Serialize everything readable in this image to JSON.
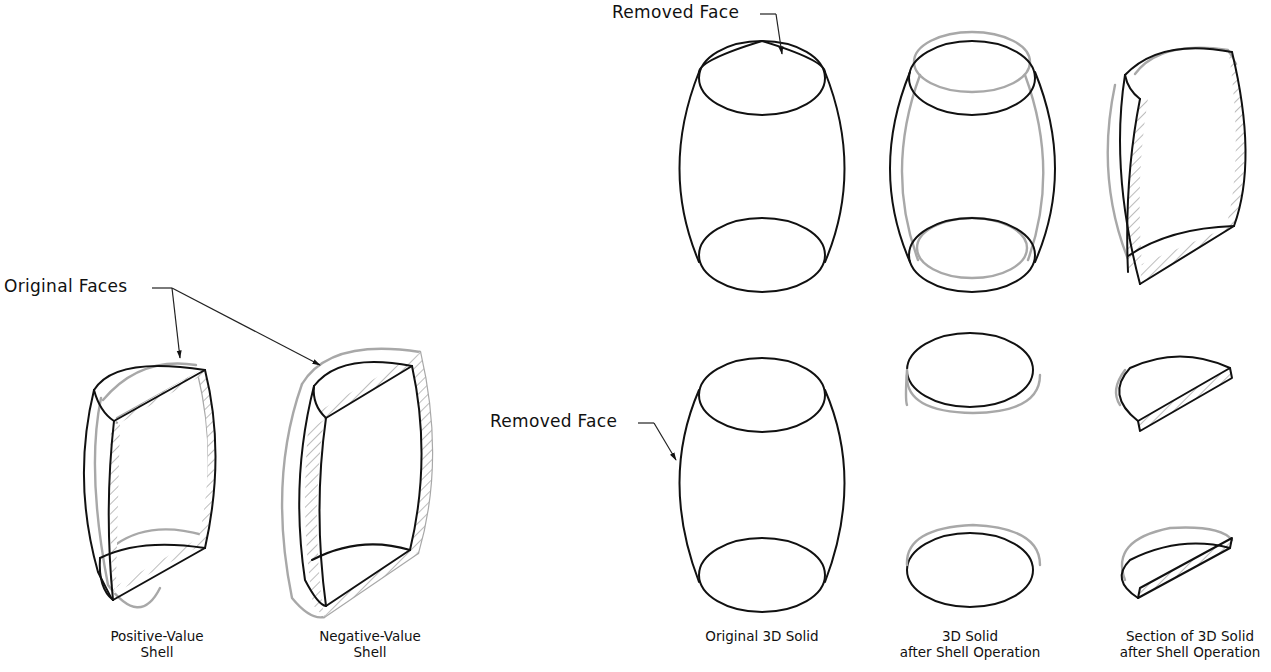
{
  "figure": {
    "callouts": {
      "original_faces": "Original Faces",
      "removed_face_top": "Removed Face",
      "removed_face_side": "Removed Face"
    },
    "captions": {
      "positive": [
        "Positive-Value",
        "Shell"
      ],
      "negative": [
        "Negative-Value",
        "Shell"
      ],
      "original": [
        "Original 3D Solid"
      ],
      "after_shell": [
        "3D Solid",
        "after Shell Operation"
      ],
      "section": [
        "Section of 3D Solid",
        "after Shell Operation"
      ]
    },
    "colors": {
      "outline": "#111111",
      "shell_offset": "#a8a8a8",
      "background": "#ffffff"
    }
  }
}
